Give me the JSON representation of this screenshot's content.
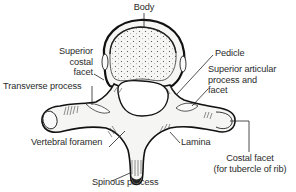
{
  "diagram": {
    "labels": {
      "body": "Body",
      "superior_costal_facet": [
        "Superior",
        "costal",
        "facet"
      ],
      "transverse_process": "Transverse process",
      "pedicle": "Pedicle",
      "superior_articular_process": [
        "Superior articular",
        "process and",
        "facet"
      ],
      "vertebral_foramen": "Vertebral foramen",
      "lamina": "Lamina",
      "costal_facet": [
        "Costal facet",
        "(for tubercle of rib)"
      ],
      "spinous_process": "Spinous process"
    },
    "colors": {
      "line": "#1a1a1a",
      "bone_fill": "#f4f4f2",
      "shade": "#555555",
      "text": "#2a2a2a",
      "background": "#ffffff"
    }
  }
}
